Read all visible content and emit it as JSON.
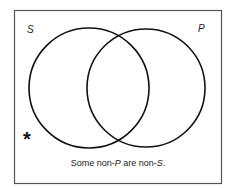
{
  "diagram": {
    "type": "venn",
    "circles": [
      {
        "label": "S",
        "cx": 89,
        "cy": 88,
        "r": 60
      },
      {
        "label": "P",
        "cx": 146,
        "cy": 88,
        "r": 59
      }
    ],
    "labels": {
      "s": "S",
      "p": "P"
    },
    "marker": {
      "symbol": "*",
      "region": "outside both (non-S and non-P)"
    },
    "caption": {
      "part1": "Some non-",
      "term1": "P",
      "part2": " are non-",
      "term2": "S",
      "part3": "."
    }
  }
}
